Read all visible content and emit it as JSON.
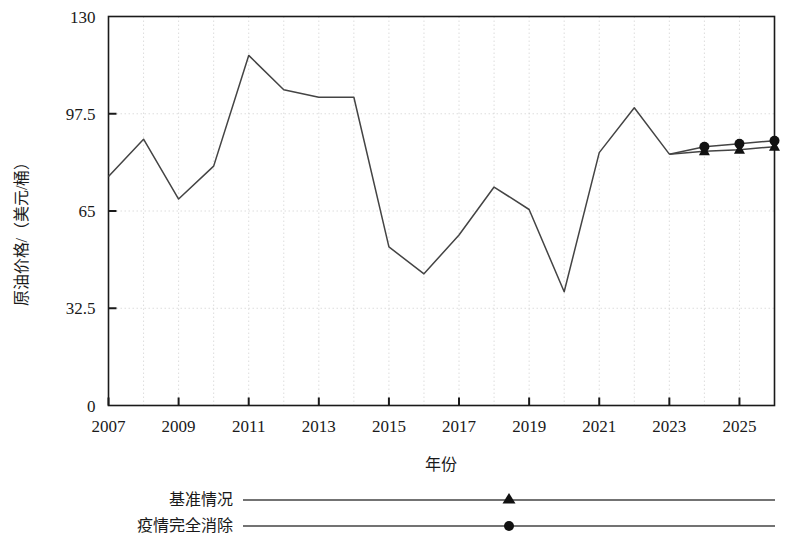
{
  "chart_data": {
    "type": "line",
    "title": "",
    "xlabel": "年份",
    "ylabel": "原油价格/（美元/桶）",
    "xlim": [
      2007,
      2026
    ],
    "ylim": [
      0,
      130
    ],
    "yticks": [
      0,
      32.5,
      65,
      97.5,
      130
    ],
    "ytick_labels": [
      "0",
      "32.5",
      "65",
      "97.5",
      "130"
    ],
    "xticks": [
      2007,
      2009,
      2011,
      2013,
      2015,
      2017,
      2019,
      2021,
      2023,
      2025
    ],
    "xtick_labels": [
      "2007",
      "2009",
      "2011",
      "2013",
      "2015",
      "2017",
      "2019",
      "2021",
      "2023",
      "2025"
    ],
    "grid": true,
    "grid_minor_x_every": 1,
    "legend_position": "below-left",
    "x": [
      2007,
      2008,
      2009,
      2010,
      2011,
      2012,
      2013,
      2014,
      2015,
      2016,
      2017,
      2018,
      2019,
      2020,
      2021,
      2022,
      2023
    ],
    "series": [
      {
        "name": "历史",
        "marker": "none",
        "values": [
          76.5,
          89.0,
          69.0,
          80.0,
          117.0,
          105.5,
          103.0,
          103.0,
          53.0,
          44.0,
          57.0,
          73.0,
          65.5,
          38.0,
          84.5,
          99.5,
          84.0
        ]
      },
      {
        "name": "基准情况",
        "marker": "triangle",
        "x": [
          2023,
          2024,
          2025,
          2026
        ],
        "values": [
          84.0,
          85.0,
          85.5,
          86.5
        ]
      },
      {
        "name": "疫情完全消除",
        "marker": "circle",
        "x": [
          2023,
          2024,
          2025,
          2026
        ],
        "values": [
          84.0,
          86.5,
          87.5,
          88.5
        ]
      }
    ]
  },
  "legend": {
    "entries": [
      {
        "label": "基准情况",
        "marker": "triangle"
      },
      {
        "label": "疫情完全消除",
        "marker": "circle"
      }
    ]
  },
  "colors": {
    "line": "#444444",
    "axis": "#1a1a1a",
    "grid": "#cfcfcf",
    "marker": "#111111"
  }
}
